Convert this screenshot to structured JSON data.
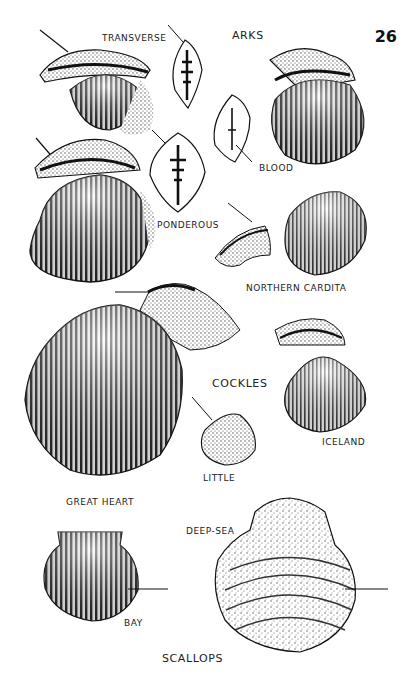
{
  "page": {
    "number": "26",
    "background": "#ffffff",
    "ink": "#1a1a1a"
  },
  "sections": [
    {
      "heading": "ARKS",
      "shells": [
        {
          "label": "TRANSVERSE"
        },
        {
          "label": "BLOOD"
        },
        {
          "label": "PONDEROUS"
        }
      ]
    },
    {
      "heading": "",
      "shells": [
        {
          "label": "NORTHERN CARDITA"
        }
      ]
    },
    {
      "heading": "COCKLES",
      "shells": [
        {
          "label": "GREAT HEART"
        },
        {
          "label": "LITTLE"
        },
        {
          "label": "ICELAND"
        }
      ]
    },
    {
      "heading": "SCALLOPS",
      "shells": [
        {
          "label": "BAY"
        },
        {
          "label": "DEEP-SEA"
        }
      ]
    }
  ]
}
